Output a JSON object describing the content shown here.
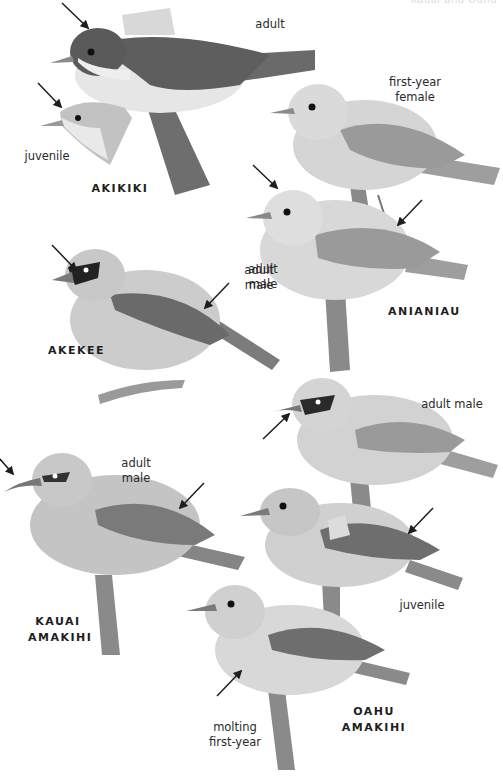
{
  "header": {
    "running_title": "Kauai and Oahu"
  },
  "species": [
    {
      "name": "AKIKIKI",
      "plumages": [
        "adult",
        "juvenile"
      ]
    },
    {
      "name": "ANIANIAU",
      "plumages": [
        "first-year female",
        "adult male"
      ]
    },
    {
      "name": "AKEKEE",
      "plumages": [
        "adult male"
      ]
    },
    {
      "name": "KAUAI AMAKIHI",
      "name_lines": [
        "KAUAI",
        "AMAKIHI"
      ],
      "plumages": [
        "adult male"
      ]
    },
    {
      "name": "OAHU AMAKIHI",
      "plumages": [
        "adult male",
        "juvenile",
        "molting first-year"
      ]
    }
  ],
  "labels": {
    "akikiki_adult": "adult",
    "akikiki_juvenile": "juvenile",
    "anianiau_fy_female_1": "first-year",
    "anianiau_fy_female_2": "female",
    "anianiau_adult_male_1": "adult",
    "anianiau_adult_male_2": "male",
    "akekee_adult_male_1": "adult",
    "akekee_adult_male_2": "male",
    "oahu_adult_male": "adult male",
    "kauai_adult_male_1": "adult",
    "kauai_adult_male_2": "male",
    "oahu_juvenile": "juvenile",
    "oahu_molting_1": "molting",
    "oahu_molting_2": "first-year"
  },
  "colors": {
    "ink": "#1e1e1e",
    "bird_dark": "#5a5a5a",
    "bird_mid": "#9a9a9a",
    "bird_light": "#c9c9c9",
    "bird_pale": "#e4e4e4",
    "branch": "#7a7a7a"
  }
}
